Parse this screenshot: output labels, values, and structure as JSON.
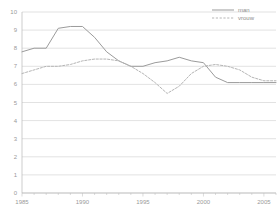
{
  "chart_data": {
    "type": "line",
    "title": "",
    "xlabel": "",
    "ylabel": "",
    "xlim": [
      1985,
      2006
    ],
    "ylim": [
      0,
      10
    ],
    "grid": true,
    "legend_position": "top-right",
    "y_ticks": [
      "0",
      "1",
      "2",
      "3",
      "4",
      "5",
      "6",
      "7",
      "8",
      "9",
      "10"
    ],
    "x_ticks": [
      "1985",
      "1990",
      "1995",
      "2000",
      "2005"
    ],
    "x_tick_values": [
      1985,
      1990,
      1995,
      2000,
      2005
    ],
    "x": [
      1985,
      1986,
      1987,
      1988,
      1989,
      1990,
      1991,
      1992,
      1993,
      1994,
      1995,
      1996,
      1997,
      1998,
      1999,
      2000,
      2001,
      2002,
      2003,
      2004,
      2005,
      2006
    ],
    "series": [
      {
        "name": "man",
        "style": "solid",
        "color": "#9b9b9b",
        "values": [
          7.8,
          8.0,
          8.0,
          9.1,
          9.2,
          9.2,
          8.6,
          7.8,
          7.3,
          7.0,
          7.0,
          7.2,
          7.3,
          7.5,
          7.3,
          7.2,
          6.4,
          6.1,
          6.1,
          6.1,
          6.1,
          6.1
        ]
      },
      {
        "name": "vrouw",
        "style": "dotted",
        "color": "#b5b5b5",
        "values": [
          6.6,
          6.8,
          7.0,
          7.0,
          7.1,
          7.3,
          7.4,
          7.4,
          7.3,
          7.0,
          6.6,
          6.1,
          5.5,
          5.9,
          6.6,
          7.0,
          7.1,
          7.0,
          6.8,
          6.4,
          6.2,
          6.2
        ]
      }
    ]
  },
  "legend": {
    "items": [
      {
        "label": "man",
        "style": "solid"
      },
      {
        "label": "vrouw",
        "style": "dotted"
      }
    ]
  }
}
